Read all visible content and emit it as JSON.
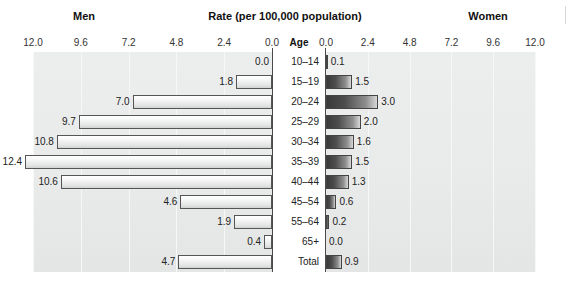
{
  "header": {
    "left_label": "Men",
    "center_label": "Rate (per 100,000 population)",
    "right_label": "Women",
    "age_column_label": "Age"
  },
  "axis": {
    "left_ticks": [
      "12.0",
      "9.6",
      "7.2",
      "4.8",
      "2.4",
      "0.0"
    ],
    "right_ticks": [
      "0.0",
      "2.4",
      "4.8",
      "7.2",
      "9.6",
      "12.0"
    ],
    "max": 12.0,
    "tick_step": 2.4
  },
  "chart_data": {
    "type": "bar",
    "title": "Rate (per 100,000 population)",
    "xlabel": "Rate (per 100,000 population)",
    "ylabel": "Age",
    "xlim": [
      0,
      12.0
    ],
    "grid": true,
    "orientation": "horizontal-pyramid",
    "categories": [
      "10–14",
      "15–19",
      "20–24",
      "25–29",
      "30–34",
      "35–39",
      "40–44",
      "45–54",
      "55–64",
      "65+",
      "Total"
    ],
    "series": [
      {
        "name": "Men",
        "side": "left",
        "values": [
          0.0,
          1.8,
          7.0,
          9.7,
          10.8,
          12.4,
          10.6,
          4.6,
          1.9,
          0.4,
          4.7
        ],
        "labels": [
          "0.0",
          "1.8",
          "7.0",
          "9.7",
          "10.8",
          "12.4",
          "10.6",
          "4.6",
          "1.9",
          "0.4",
          "4.7"
        ]
      },
      {
        "name": "Women",
        "side": "right",
        "values": [
          0.1,
          1.5,
          3.0,
          2.0,
          1.6,
          1.5,
          1.3,
          0.6,
          0.2,
          0.0,
          0.9
        ],
        "labels": [
          "0.1",
          "1.5",
          "3.0",
          "2.0",
          "1.6",
          "1.5",
          "1.3",
          "0.6",
          "0.2",
          "0.0",
          "0.9"
        ]
      }
    ],
    "legend_position": "top"
  },
  "colors": {
    "panel_background": "#eaebeb",
    "men_bar": "#e8e9e9",
    "women_bar": "#4d4d4d",
    "axis_line": "#4a4a4a",
    "text": "#1a1a1a"
  }
}
